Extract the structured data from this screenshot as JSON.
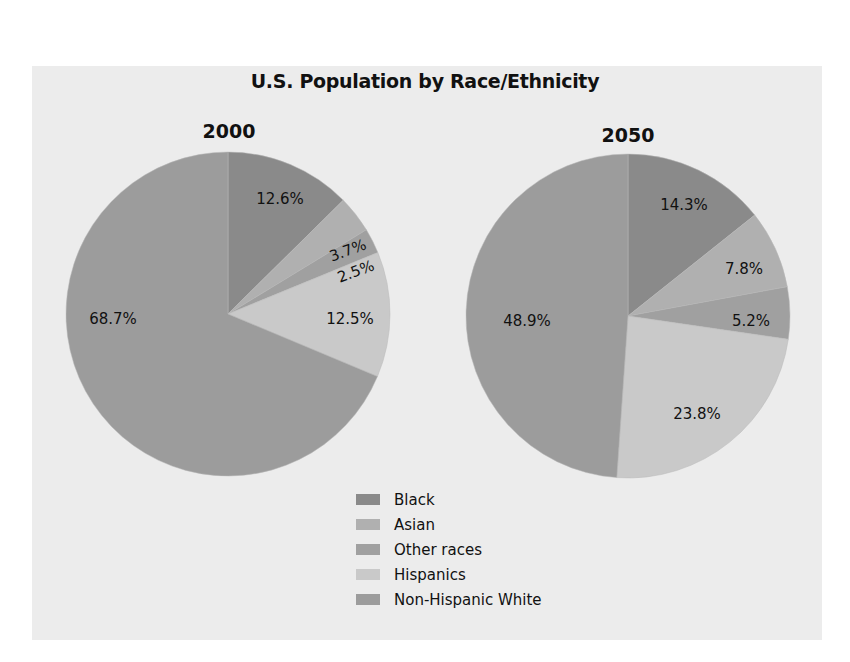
{
  "chart_data": {
    "type": "pie",
    "title": "U.S. Population by Race/Ethnicity",
    "categories": [
      "Black",
      "Asian",
      "Other races",
      "Hispanics",
      "Non-Hispanic White"
    ],
    "colors": {
      "Black": "#8a8a8a",
      "Asian": "#b0b0b0",
      "Other races": "#a0a0a0",
      "Hispanics": "#c9c9c9",
      "Non-Hispanic White": "#9c9c9c"
    },
    "series": [
      {
        "name": "2000",
        "values": [
          12.6,
          3.7,
          2.5,
          12.5,
          68.7
        ],
        "labels": [
          "12.6%",
          "3.7%",
          "2.5%",
          "12.5%",
          "68.7%"
        ]
      },
      {
        "name": "2050",
        "values": [
          14.3,
          7.8,
          5.2,
          23.8,
          48.9
        ],
        "labels": [
          "14.3%",
          "7.8%",
          "5.2%",
          "23.8%",
          "48.9%"
        ]
      }
    ],
    "legend_position": "bottom-center"
  },
  "header": {
    "title": "U.S. Population by Race/Ethnicity"
  },
  "pies": [
    {
      "year": "2000"
    },
    {
      "year": "2050"
    }
  ],
  "legend": {
    "items": [
      {
        "label": "Black",
        "color": "#8a8a8a"
      },
      {
        "label": "Asian",
        "color": "#b0b0b0"
      },
      {
        "label": "Other races",
        "color": "#a0a0a0"
      },
      {
        "label": "Hispanics",
        "color": "#c9c9c9"
      },
      {
        "label": "Non-Hispanic White",
        "color": "#9c9c9c"
      }
    ]
  },
  "background": {
    "panel_color": "#ececec"
  }
}
